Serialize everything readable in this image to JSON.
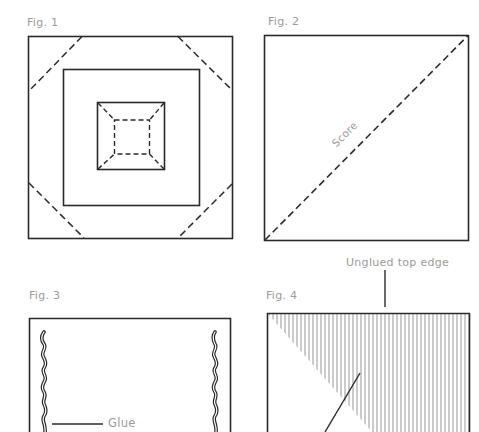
{
  "figures": [
    {
      "id": "fig1",
      "label": "Fig. 1",
      "description": "Square with nested square and inner dashed square; corner fold score lines"
    },
    {
      "id": "fig2",
      "label": "Fig. 2",
      "description": "Square with diagonal dashed score line",
      "annotation": "Score"
    },
    {
      "id": "fig3",
      "label": "Fig. 3",
      "description": "Rectangle with wavy glue lines on both sides",
      "annotation": "Glue"
    },
    {
      "id": "fig4",
      "label": "Fig. 4",
      "description": "Rectangle with hatched triangular region",
      "annotation": "Unglued top edge"
    }
  ],
  "colors": {
    "line": "#2a2a2a",
    "label": "#9a9a9a",
    "hatch": "#8a8a8a",
    "background": "#ffffff"
  }
}
